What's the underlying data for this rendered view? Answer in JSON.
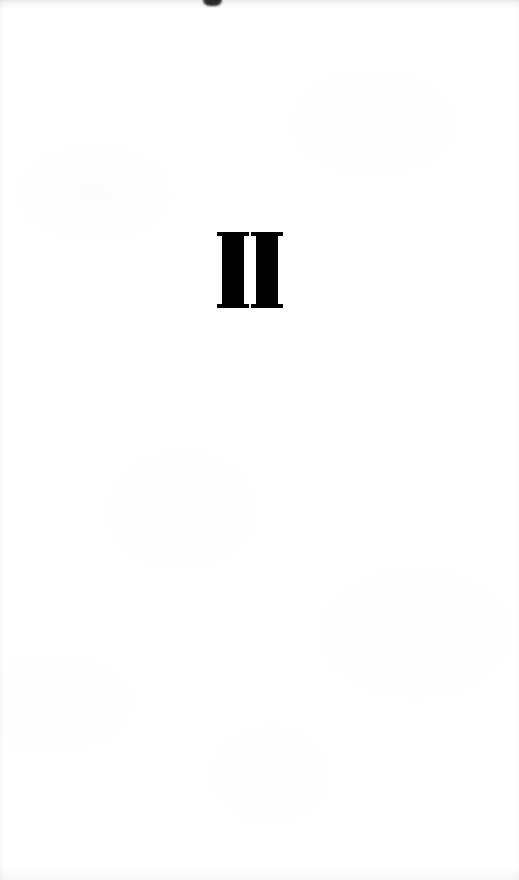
{
  "document": {
    "type": "book-part-title-page",
    "page_width": 519,
    "page_height": 880,
    "background_color": "#ffffff",
    "ink_color": "#000000"
  },
  "part_title": {
    "numeral": "II",
    "numeral_value": 2,
    "numeral_system": "roman",
    "typeface_style": "bold-serif-didone",
    "alignment": "center",
    "position": {
      "left": 217,
      "top": 232,
      "width": 66,
      "height": 76
    }
  },
  "glyph_metrics": {
    "stem_width": 22,
    "stem_gap": 9,
    "serif_thickness": 4,
    "serif_overhang": 5
  },
  "artifacts": {
    "top_ink_blot": {
      "name": "ink-blot",
      "left": 203,
      "top": 0,
      "width": 19,
      "height": 6,
      "color": "#1a1a1a"
    },
    "edge_shadows": {
      "top": true,
      "bottom": true,
      "left": true,
      "right": true
    },
    "paper_texture": "faint-mottled-offwhite"
  },
  "body_text": {
    "content": "",
    "note": "page is otherwise blank"
  }
}
